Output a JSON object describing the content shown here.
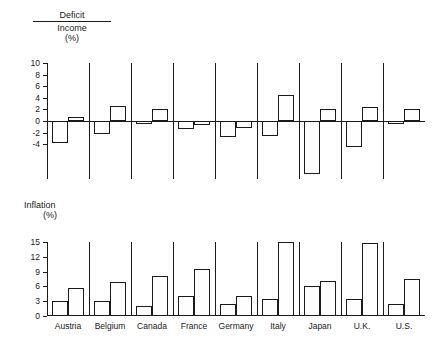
{
  "figure": {
    "deficit_title": {
      "numerator": "Deficit",
      "denominator": "Income",
      "unit": "(%)"
    },
    "inflation_title": {
      "label": "Inflation",
      "unit": "(%)"
    }
  },
  "chart_data": [
    {
      "type": "bar",
      "title": "Deficit / Income (%)",
      "xlabel": "",
      "ylabel": "Deficit/Income (%)",
      "ylim": [
        -10,
        10
      ],
      "yticks": [
        10,
        8,
        6,
        4,
        2,
        0,
        -2,
        -4
      ],
      "ytick_labels": [
        "10",
        "8",
        "6",
        "4",
        "2",
        "0",
        "-2",
        "-4"
      ],
      "grid": false,
      "legend": "none",
      "zero_line": true,
      "categories": [
        "Austria",
        "Belgium",
        "Canada",
        "France",
        "Germany",
        "Italy",
        "Japan",
        "U.K.",
        "U.S."
      ],
      "series": [
        {
          "name": "Period 1",
          "values": [
            -3.8,
            -2.2,
            -0.6,
            -1.4,
            -2.8,
            -2.5,
            -9.2,
            -4.5,
            -0.5
          ]
        },
        {
          "name": "Period 2",
          "values": [
            0.7,
            2.6,
            2.1,
            -0.7,
            -1.2,
            4.5,
            2.0,
            2.5,
            2.0
          ]
        }
      ]
    },
    {
      "type": "bar",
      "title": "Inflation (%)",
      "xlabel": "",
      "ylabel": "Inflation (%)",
      "ylim": [
        0,
        15
      ],
      "yticks": [
        15,
        12,
        9,
        6,
        3,
        0
      ],
      "ytick_labels": [
        "15",
        "12",
        "9",
        "6",
        "3",
        "0"
      ],
      "grid": false,
      "legend": "none",
      "categories": [
        "Austria",
        "Belgium",
        "Canada",
        "France",
        "Germany",
        "Italy",
        "Japan",
        "U.K.",
        "U.S."
      ],
      "series": [
        {
          "name": "Period 1",
          "values": [
            3.0,
            3.0,
            2.0,
            4.0,
            2.5,
            3.5,
            6.0,
            3.5,
            2.5
          ]
        },
        {
          "name": "Period 2",
          "values": [
            5.6,
            6.9,
            8.2,
            9.5,
            4.0,
            15.0,
            7.0,
            14.8,
            7.5
          ]
        }
      ]
    }
  ]
}
